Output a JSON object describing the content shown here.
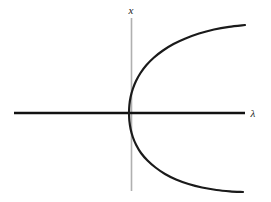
{
  "figure": {
    "background_color": "#ffffff"
  },
  "axes": {
    "vertical": {
      "label": "x",
      "name": "x-axis",
      "color": "#b0b0b0",
      "x": 131.5,
      "y_top": 18,
      "y_bottom": 191,
      "width": 1.6
    },
    "horizontal": {
      "label": "λ",
      "name": "lambda-axis",
      "color": "#111111",
      "y": 113,
      "x_left": 14,
      "x_right": 245,
      "width": 2.4
    }
  },
  "labels": {
    "vertical_axis_label": "x",
    "vertical_axis_label_x": 131,
    "vertical_axis_label_y": 14,
    "horizontal_axis_label": "λ",
    "horizontal_axis_label_x": 253,
    "horizontal_axis_label_y": 117
  },
  "chart_data": {
    "type": "line",
    "subtitle": "",
    "xlabel": "λ",
    "ylabel": "x",
    "grid": false,
    "legend": null,
    "curve_color": "#1a1a1a",
    "curve_width": 2.2,
    "equation": "x^2 = λ",
    "origin_px": {
      "x": 131.5,
      "y": 113
    },
    "xlim": [
      -0.08,
      1.0
    ],
    "ylim": [
      -1.05,
      1.0
    ],
    "series": [
      {
        "name": "upper-branch",
        "expression": "x = +sqrt(λ)",
        "points_px": [
          [
            129.0,
            113.0
          ],
          [
            129.4,
            105.0
          ],
          [
            130.6,
            97.0
          ],
          [
            132.8,
            89.0
          ],
          [
            136.0,
            81.0
          ],
          [
            140.5,
            73.0
          ],
          [
            146.5,
            65.0
          ],
          [
            154.0,
            57.5
          ],
          [
            163.0,
            50.5
          ],
          [
            173.5,
            44.0
          ],
          [
            185.5,
            38.5
          ],
          [
            199.0,
            33.5
          ],
          [
            214.0,
            29.5
          ],
          [
            229.0,
            26.8
          ],
          [
            245.0,
            25.0
          ]
        ]
      },
      {
        "name": "lower-branch",
        "expression": "x = -sqrt(λ)",
        "points_px": [
          [
            129.0,
            113.0
          ],
          [
            129.4,
            121.0
          ],
          [
            130.6,
            129.0
          ],
          [
            132.8,
            137.0
          ],
          [
            136.2,
            145.0
          ],
          [
            141.0,
            153.0
          ],
          [
            147.5,
            160.5
          ],
          [
            155.5,
            167.5
          ],
          [
            165.0,
            174.0
          ],
          [
            176.0,
            179.5
          ],
          [
            188.5,
            184.0
          ],
          [
            202.0,
            187.5
          ],
          [
            216.5,
            190.0
          ],
          [
            230.0,
            191.3
          ],
          [
            243.0,
            192.0
          ]
        ]
      }
    ]
  }
}
